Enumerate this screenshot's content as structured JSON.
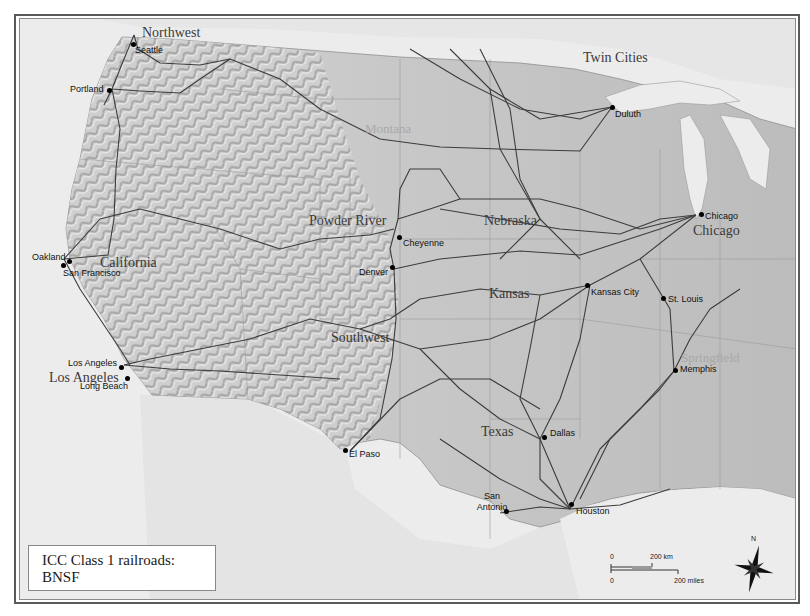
{
  "map": {
    "subject": "BNSF railroad network, contiguous United States",
    "colors": {
      "land": "#c4c4c4",
      "land_light": "#d6d6d6",
      "relief_dark": "#a9a9a9",
      "water": "#ececec",
      "foreign_land": "#e2e2e2",
      "rail": "#3c3c3c",
      "border": "#8f8f8f"
    }
  },
  "legend": {
    "line1": "ICC Class 1 railroads:",
    "line2": "BNSF"
  },
  "regions": [
    {
      "id": "northwest",
      "label": "Northwest"
    },
    {
      "id": "twin-cities",
      "label": "Twin Cities"
    },
    {
      "id": "montana",
      "label": "Montana"
    },
    {
      "id": "powder-river",
      "label": "Powder River"
    },
    {
      "id": "nebraska",
      "label": "Nebraska"
    },
    {
      "id": "california",
      "label": "California"
    },
    {
      "id": "chicago",
      "label": "Chicago"
    },
    {
      "id": "kansas",
      "label": "Kansas"
    },
    {
      "id": "southwest",
      "label": "Southwest"
    },
    {
      "id": "springfield",
      "label": "Springfield"
    },
    {
      "id": "los-angeles",
      "label": "Los Angeles"
    },
    {
      "id": "texas",
      "label": "Texas"
    }
  ],
  "cities": [
    {
      "id": "seattle",
      "label": "Seattle"
    },
    {
      "id": "portland",
      "label": "Portland"
    },
    {
      "id": "duluth",
      "label": "Duluth"
    },
    {
      "id": "chicago",
      "label": "Chicago"
    },
    {
      "id": "cheyenne",
      "label": "Cheyenne"
    },
    {
      "id": "denver",
      "label": "Denver"
    },
    {
      "id": "oakland",
      "label": "Oakland"
    },
    {
      "id": "san-francisco",
      "label": "San Francisco"
    },
    {
      "id": "kansas-city",
      "label": "Kansas City"
    },
    {
      "id": "st-louis",
      "label": "St. Louis"
    },
    {
      "id": "memphis",
      "label": "Memphis"
    },
    {
      "id": "los-angeles",
      "label": "Los Angeles"
    },
    {
      "id": "long-beach",
      "label": "Long Beach"
    },
    {
      "id": "el-paso",
      "label": "El Paso"
    },
    {
      "id": "dallas",
      "label": "Dallas"
    },
    {
      "id": "san-antonio",
      "label": "San Antonio"
    },
    {
      "id": "houston",
      "label": "Houston"
    }
  ],
  "scale_bar": {
    "km_zero": "0",
    "km_label": "200 km",
    "mi_zero": "0",
    "mi_label": "200 miles"
  },
  "compass": {
    "north_label": "N"
  }
}
